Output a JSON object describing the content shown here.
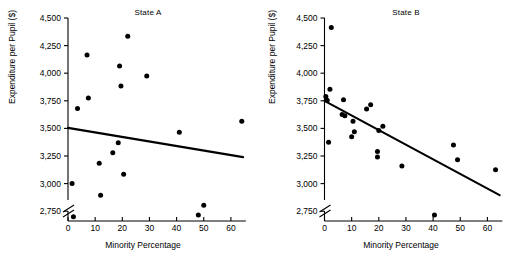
{
  "figure": {
    "panels": [
      {
        "id": "state-a",
        "title": "State A",
        "xlabel": "Minority Percentage",
        "ylabel": "Expenditure per Pupil ($)"
      },
      {
        "id": "state-b",
        "title": "State B",
        "xlabel": "Minority Percentage",
        "ylabel": "Expenditure per Pupil ($)"
      }
    ]
  },
  "chart_data": [
    {
      "type": "scatter",
      "title": "State A",
      "xlabel": "Minority Percentage",
      "ylabel": "Expenditure per Pupil ($)",
      "xlim": [
        0,
        65
      ],
      "ylim": [
        2650,
        4500
      ],
      "xticks": [
        0,
        10,
        20,
        30,
        40,
        50,
        60
      ],
      "xtick_labels": [
        "0",
        "10",
        "20",
        "30",
        "40",
        "50",
        "60"
      ],
      "yticks": [
        2750,
        3000,
        3250,
        3500,
        3750,
        4000,
        4250,
        4500
      ],
      "ytick_labels": [
        "2,750",
        "3,000",
        "3,250",
        "3,500",
        "3,750",
        "4,000",
        "4,250",
        "4,500"
      ],
      "y_axis_break": true,
      "grid": false,
      "legend": "none",
      "points": [
        {
          "x": 1.5,
          "y": 3000
        },
        {
          "x": 2.0,
          "y": 2700
        },
        {
          "x": 3.5,
          "y": 3680
        },
        {
          "x": 7.0,
          "y": 4165
        },
        {
          "x": 7.5,
          "y": 3775
        },
        {
          "x": 11.5,
          "y": 3185
        },
        {
          "x": 12.0,
          "y": 2895
        },
        {
          "x": 16.5,
          "y": 3280
        },
        {
          "x": 18.5,
          "y": 3370
        },
        {
          "x": 19.0,
          "y": 4065
        },
        {
          "x": 19.5,
          "y": 3885
        },
        {
          "x": 20.5,
          "y": 3085
        },
        {
          "x": 22.0,
          "y": 4335
        },
        {
          "x": 29.0,
          "y": 3975
        },
        {
          "x": 41.0,
          "y": 3465
        },
        {
          "x": 48.0,
          "y": 2635
        },
        {
          "x": 50.0,
          "y": 2805
        },
        {
          "x": 64.0,
          "y": 3565
        }
      ],
      "trend_line": {
        "x": [
          0,
          64.5
        ],
        "y": [
          3505,
          3240
        ]
      }
    },
    {
      "type": "scatter",
      "title": "State B",
      "xlabel": "Minority Percentage",
      "ylabel": "Expenditure per Pupil ($)",
      "xlim": [
        0,
        65
      ],
      "ylim": [
        2650,
        4500
      ],
      "xticks": [
        0,
        10,
        20,
        30,
        40,
        50,
        60
      ],
      "xtick_labels": [
        "0",
        "10",
        "20",
        "30",
        "40",
        "50",
        "60"
      ],
      "yticks": [
        2750,
        3000,
        3250,
        3500,
        3750,
        4000,
        4250,
        4500
      ],
      "ytick_labels": [
        "2,750",
        "3,000",
        "3,250",
        "3,500",
        "3,750",
        "4,000",
        "4,250",
        "4,500"
      ],
      "y_axis_break": true,
      "grid": false,
      "legend": "none",
      "points": [
        {
          "x": 0.5,
          "y": 3790
        },
        {
          "x": 1.0,
          "y": 3755
        },
        {
          "x": 1.5,
          "y": 3375
        },
        {
          "x": 2.0,
          "y": 3855
        },
        {
          "x": 2.5,
          "y": 4415
        },
        {
          "x": 6.5,
          "y": 3625
        },
        {
          "x": 7.0,
          "y": 3760
        },
        {
          "x": 7.5,
          "y": 3615
        },
        {
          "x": 10.0,
          "y": 3425
        },
        {
          "x": 10.5,
          "y": 3565
        },
        {
          "x": 11.0,
          "y": 3470
        },
        {
          "x": 15.5,
          "y": 3675
        },
        {
          "x": 17.0,
          "y": 3715
        },
        {
          "x": 19.5,
          "y": 3290
        },
        {
          "x": 19.5,
          "y": 3240
        },
        {
          "x": 20.0,
          "y": 3480
        },
        {
          "x": 21.5,
          "y": 3520
        },
        {
          "x": 28.5,
          "y": 3160
        },
        {
          "x": 40.5,
          "y": 2635
        },
        {
          "x": 47.5,
          "y": 3350
        },
        {
          "x": 49.0,
          "y": 3215
        },
        {
          "x": 63.0,
          "y": 3125
        }
      ],
      "trend_line": {
        "x": [
          0,
          64.5
        ],
        "y": [
          3750,
          2895
        ]
      }
    }
  ]
}
